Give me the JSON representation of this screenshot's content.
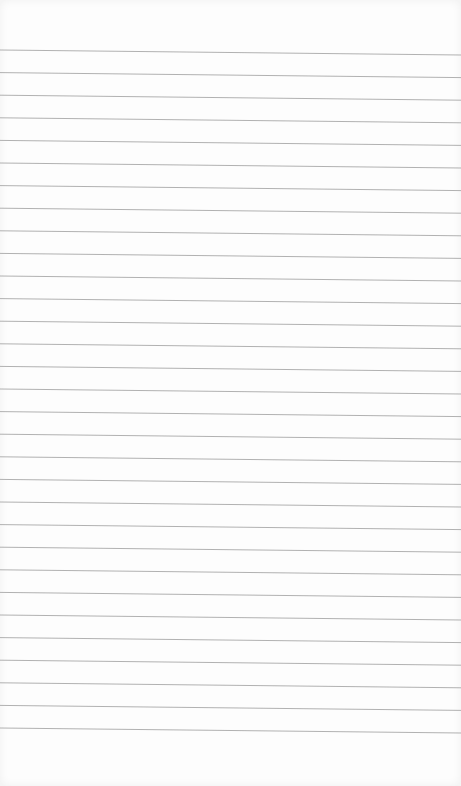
{
  "paper": {
    "type": "lined-paper",
    "background": "#fdfdfd",
    "line_color": "#a8a8a8",
    "line_count": 31,
    "first_line_left_y": 50,
    "line_spacing": 22.6,
    "slant_px": 5
  }
}
